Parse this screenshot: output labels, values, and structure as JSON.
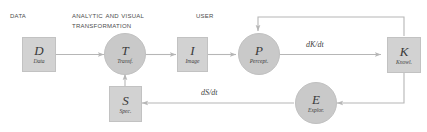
{
  "diagram": {
    "colors": {
      "node_fill": "#d2d2d2",
      "circle_fill": "#c9c9c9",
      "node_border": "#c2c2c2",
      "arrow": "#b6b6b6",
      "header_text": "#4c4c4c",
      "node_text": "#3a3a3a",
      "background": "#ffffff"
    },
    "headers": [
      {
        "name": "data",
        "label": "Data"
      },
      {
        "name": "analytic-and-visual-transformation",
        "label": "Analytic and visual\ntransformation"
      },
      {
        "name": "user",
        "label": "User"
      }
    ],
    "nodes": [
      {
        "id": "D",
        "shape": "square",
        "symbol": "D",
        "sublabel": "Data"
      },
      {
        "id": "T",
        "shape": "circle",
        "symbol": "T",
        "sublabel": "Transf."
      },
      {
        "id": "I",
        "shape": "square",
        "symbol": "I",
        "sublabel": "Image"
      },
      {
        "id": "P",
        "shape": "circle",
        "symbol": "P",
        "sublabel": "Percept."
      },
      {
        "id": "K",
        "shape": "square",
        "symbol": "K",
        "sublabel": "Knowl."
      },
      {
        "id": "E",
        "shape": "circle",
        "symbol": "E",
        "sublabel": "Explor."
      },
      {
        "id": "S",
        "shape": "square",
        "symbol": "S",
        "sublabel": "Spec."
      }
    ],
    "edge_labels": [
      {
        "name": "dk-dt",
        "label": "dK/dt"
      },
      {
        "name": "ds-dt",
        "label": "dS/dt"
      }
    ],
    "edges": [
      {
        "from": "D",
        "to": "T",
        "label": ""
      },
      {
        "from": "T",
        "to": "I",
        "label": ""
      },
      {
        "from": "I",
        "to": "P",
        "label": ""
      },
      {
        "from": "P",
        "to": "K",
        "label": "dK/dt"
      },
      {
        "from": "K",
        "to": "P",
        "label": ""
      },
      {
        "from": "K",
        "to": "E",
        "label": ""
      },
      {
        "from": "E",
        "to": "S",
        "label": "dS/dt"
      },
      {
        "from": "S",
        "to": "T",
        "label": ""
      }
    ]
  }
}
